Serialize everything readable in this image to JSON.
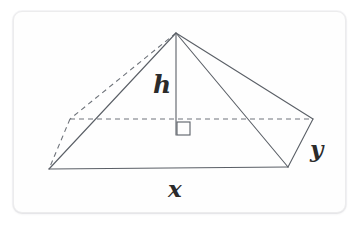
{
  "figure": {
    "name": "rectangular-pyramid-diagram",
    "card": {
      "background_color": "#fefefe",
      "border_color": "#ececed"
    },
    "stroke": {
      "solid_color": "#5a5f66",
      "dashed_color": "#6e737a",
      "width": 1.1,
      "dash_pattern": "5 4"
    },
    "labels": [
      {
        "id": "h",
        "text": "h",
        "meaning": "height",
        "x": 153,
        "y": 72
      },
      {
        "id": "x",
        "text": "x",
        "meaning": "base-length",
        "x": 168,
        "y": 177
      },
      {
        "id": "y",
        "text": "y",
        "meaning": "base-width",
        "x": 310,
        "y": 137
      }
    ],
    "vertices": {
      "apex": {
        "x": 176,
        "y": 33
      },
      "front_left_base": {
        "x": 49,
        "y": 169
      },
      "front_right_base": {
        "x": 288,
        "y": 167
      },
      "back_left_base": {
        "x": 70,
        "y": 119
      },
      "back_right_base": {
        "x": 313,
        "y": 119
      },
      "height_foot": {
        "x": 176,
        "y": 135
      }
    },
    "edges": {
      "solid": [
        {
          "name": "base-front-edge",
          "from": "front_left_base",
          "to": "front_right_base"
        },
        {
          "name": "base-right-edge",
          "from": "front_right_base",
          "to": "back_right_base"
        },
        {
          "name": "lateral-edge-front-left",
          "from": "apex",
          "to": "front_left_base"
        },
        {
          "name": "lateral-edge-front-right",
          "from": "apex",
          "to": "front_right_base"
        },
        {
          "name": "lateral-edge-back-right",
          "from": "apex",
          "to": "back_right_base"
        },
        {
          "name": "height-segment",
          "from": "apex",
          "to": "height_foot"
        }
      ],
      "dashed": [
        {
          "name": "base-back-edge",
          "from": "back_left_base",
          "to": "back_right_base"
        },
        {
          "name": "base-left-edge",
          "from": "back_left_base",
          "to": "front_left_base"
        },
        {
          "name": "lateral-edge-back-left",
          "from": "apex",
          "to": "back_left_base"
        }
      ]
    },
    "right_angle_marker": {
      "name": "right-angle-square",
      "x": 177,
      "y": 122,
      "size": 13
    }
  }
}
